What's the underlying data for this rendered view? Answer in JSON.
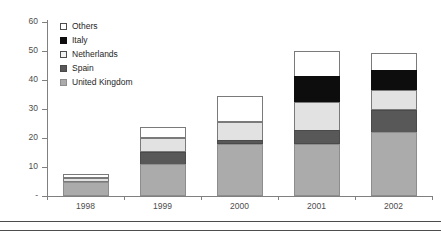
{
  "chart_data": {
    "type": "bar",
    "subtype": "stacked-column",
    "title": "",
    "xlabel": "",
    "ylabel": "",
    "categories": [
      "1998",
      "1999",
      "2000",
      "2001",
      "2002"
    ],
    "ylim": [
      0,
      60
    ],
    "yticks": [
      0,
      10,
      20,
      30,
      40,
      50,
      60
    ],
    "ytick_labels": [
      "-",
      "10",
      "20",
      "30",
      "40",
      "50",
      "60"
    ],
    "grid": false,
    "legend_position": "top-left",
    "stack_order_bottom_to_top": [
      "United Kingdom",
      "Spain",
      "Netherlands",
      "Italy",
      "Others"
    ],
    "series": [
      {
        "name": "United Kingdom",
        "color": "#ababab",
        "values": [
          5,
          11,
          18,
          18,
          22
        ]
      },
      {
        "name": "Spain",
        "color": "#585858",
        "values": [
          0,
          4.5,
          1.5,
          5,
          8
        ]
      },
      {
        "name": "Netherlands",
        "color": "#e2e2e2",
        "values": [
          1.5,
          5,
          6.5,
          10,
          7
        ]
      },
      {
        "name": "Italy",
        "color": "#0d0d0d",
        "values": [
          0,
          0,
          0,
          9,
          7
        ]
      },
      {
        "name": "Others",
        "color": "#ffffff",
        "values": [
          1.5,
          4,
          9,
          9,
          6
        ]
      }
    ],
    "totals": [
      8,
      24.5,
      35,
      51,
      50
    ]
  },
  "legend": {
    "items": [
      {
        "label": "Others",
        "swatch": "others"
      },
      {
        "label": "Italy",
        "swatch": "italy"
      },
      {
        "label": "Netherlands",
        "swatch": "netherlands"
      },
      {
        "label": "Spain",
        "swatch": "spain"
      },
      {
        "label": "United Kingdom",
        "swatch": "uk"
      }
    ]
  },
  "axis": {
    "y_tick_labels": [
      "60",
      "50",
      "40",
      "30",
      "20",
      "10",
      "-"
    ],
    "x_tick_labels": [
      "1998",
      "1999",
      "2000",
      "2001",
      "2002"
    ]
  }
}
